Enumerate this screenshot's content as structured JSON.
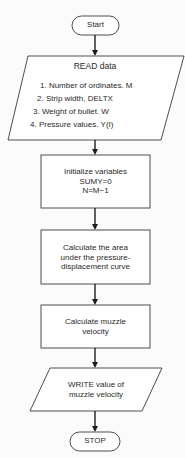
{
  "flowchart": {
    "start": {
      "label": "Start"
    },
    "read": {
      "title": "READ data",
      "items": [
        "1.  Number of ordinates. M",
        "2.  Strip width, DELTX",
        "3.  Weight of bullet. W",
        "4.  Pressure values. Y(I)"
      ]
    },
    "init": {
      "lines": [
        "Initialize variables",
        "SUMY=0",
        "N=M−1"
      ]
    },
    "area": {
      "lines": [
        "Calculate the area",
        "under the pressure-",
        "displacement curve"
      ]
    },
    "muzzle": {
      "lines": [
        "Calculate muzzle",
        "velocity"
      ]
    },
    "write": {
      "lines": [
        "WRITE value of",
        "muzzle velocity"
      ]
    },
    "stop": {
      "label": "STOP"
    }
  }
}
